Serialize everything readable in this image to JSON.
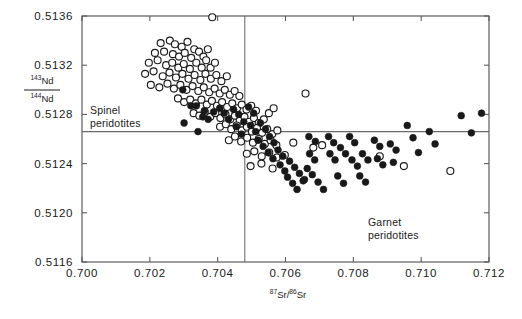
{
  "figure": {
    "background": "#ffffff",
    "frame_color": "#55555a",
    "open_marker_color": "#ffffff",
    "filled_marker_color": "#191919",
    "label_spinel_line1": "Spinel",
    "label_spinel_line2": "peridotites",
    "label_garnet_line1": "Garnet",
    "label_garnet_line2": "peridotites",
    "ylabel_numerator_sup": "143",
    "ylabel_numerator_base": "Nd",
    "ylabel_denominator_sup": "144",
    "ylabel_denominator_base": "Nd",
    "xlabel_sup1": "87",
    "xlabel_base1": "Sr",
    "xlabel_slash": "/",
    "xlabel_sup2": "86",
    "xlabel_base2": "Sr"
  },
  "chart_data": {
    "type": "scatter",
    "title": "",
    "xlabel": "87Sr/86Sr",
    "ylabel": "143Nd/144Nd",
    "xlim": [
      0.7,
      0.712
    ],
    "ylim": [
      0.5116,
      0.5136
    ],
    "xticks": [
      0.7,
      0.702,
      0.704,
      0.706,
      0.708,
      0.71,
      0.712
    ],
    "xtick_labels": [
      "0.700",
      "0.702",
      "0.704",
      "0.706",
      "0.708",
      "0.710",
      "0.712"
    ],
    "yticks": [
      0.5116,
      0.512,
      0.5124,
      0.5128,
      0.5132,
      0.5136
    ],
    "ytick_labels": [
      "0.5116",
      "0.5120",
      "0.5124",
      "0.5128",
      "0.5132",
      "0.5136"
    ],
    "grid": false,
    "legend": "none",
    "reference_lines": [
      {
        "orientation": "horizontal",
        "value": 0.51266,
        "name": "chur-nd-reference-line"
      },
      {
        "orientation": "vertical",
        "value": 0.7048,
        "name": "sr-divider-line"
      }
    ],
    "annotations": [
      {
        "text": "Spinel peridotites",
        "x": 0.7007,
        "y": 0.5129
      },
      {
        "text": "Garnet peridotites",
        "x": 0.7073,
        "y": 0.51205
      }
    ],
    "series": [
      {
        "name": "Spinel peridotites",
        "marker": "open-circle",
        "points": [
          [
            0.70384,
            0.51359
          ],
          [
            0.70232,
            0.51338
          ],
          [
            0.70259,
            0.5134
          ],
          [
            0.70274,
            0.51337
          ],
          [
            0.70294,
            0.51335
          ],
          [
            0.70311,
            0.51339
          ],
          [
            0.70331,
            0.51333
          ],
          [
            0.70215,
            0.5133
          ],
          [
            0.70242,
            0.51331
          ],
          [
            0.70268,
            0.51329
          ],
          [
            0.70286,
            0.51327
          ],
          [
            0.70303,
            0.5133
          ],
          [
            0.70322,
            0.51326
          ],
          [
            0.70345,
            0.51331
          ],
          [
            0.70358,
            0.51327
          ],
          [
            0.70371,
            0.51333
          ],
          [
            0.70197,
            0.51322
          ],
          [
            0.70223,
            0.51324
          ],
          [
            0.70248,
            0.5132
          ],
          [
            0.70266,
            0.51322
          ],
          [
            0.70284,
            0.51318
          ],
          [
            0.703,
            0.51321
          ],
          [
            0.70318,
            0.51317
          ],
          [
            0.70337,
            0.51322
          ],
          [
            0.70353,
            0.51318
          ],
          [
            0.70366,
            0.51324
          ],
          [
            0.70379,
            0.51318
          ],
          [
            0.70392,
            0.51322
          ],
          [
            0.70186,
            0.51313
          ],
          [
            0.70211,
            0.51315
          ],
          [
            0.70238,
            0.51311
          ],
          [
            0.70258,
            0.51314
          ],
          [
            0.70277,
            0.5131
          ],
          [
            0.70296,
            0.51313
          ],
          [
            0.70314,
            0.51309
          ],
          [
            0.70332,
            0.51312
          ],
          [
            0.70349,
            0.51308
          ],
          [
            0.70364,
            0.51313
          ],
          [
            0.7038,
            0.51309
          ],
          [
            0.70396,
            0.51312
          ],
          [
            0.70411,
            0.51307
          ],
          [
            0.70427,
            0.51311
          ],
          [
            0.70203,
            0.51304
          ],
          [
            0.70228,
            0.51302
          ],
          [
            0.70252,
            0.51305
          ],
          [
            0.70271,
            0.51301
          ],
          [
            0.7029,
            0.51304
          ],
          [
            0.70308,
            0.513
          ],
          [
            0.70326,
            0.51303
          ],
          [
            0.70343,
            0.51299
          ],
          [
            0.70359,
            0.51302
          ],
          [
            0.70375,
            0.51298
          ],
          [
            0.70391,
            0.51301
          ],
          [
            0.70406,
            0.51297
          ],
          [
            0.70421,
            0.513
          ],
          [
            0.70436,
            0.51296
          ],
          [
            0.7045,
            0.51299
          ],
          [
            0.70464,
            0.51295
          ],
          [
            0.70283,
            0.51293
          ],
          [
            0.70301,
            0.5129
          ],
          [
            0.70319,
            0.51292
          ],
          [
            0.70336,
            0.51289
          ],
          [
            0.70352,
            0.51292
          ],
          [
            0.70368,
            0.51288
          ],
          [
            0.70383,
            0.51291
          ],
          [
            0.70398,
            0.51287
          ],
          [
            0.70413,
            0.5129
          ],
          [
            0.70428,
            0.51286
          ],
          [
            0.70443,
            0.51289
          ],
          [
            0.70457,
            0.51285
          ],
          [
            0.70471,
            0.51288
          ],
          [
            0.70485,
            0.51284
          ],
          [
            0.70499,
            0.51287
          ],
          [
            0.70513,
            0.51283
          ],
          [
            0.70329,
            0.51281
          ],
          [
            0.70346,
            0.51279
          ],
          [
            0.70362,
            0.51282
          ],
          [
            0.70378,
            0.51278
          ],
          [
            0.70393,
            0.51281
          ],
          [
            0.70408,
            0.51277
          ],
          [
            0.70423,
            0.5128
          ],
          [
            0.70437,
            0.51276
          ],
          [
            0.70451,
            0.51279
          ],
          [
            0.70465,
            0.51275
          ],
          [
            0.70479,
            0.51278
          ],
          [
            0.70493,
            0.51274
          ],
          [
            0.70507,
            0.51277
          ],
          [
            0.70521,
            0.51273
          ],
          [
            0.70536,
            0.51276
          ],
          [
            0.70551,
            0.51281
          ],
          [
            0.70565,
            0.51285
          ],
          [
            0.70407,
            0.5127
          ],
          [
            0.70424,
            0.51272
          ],
          [
            0.7044,
            0.51268
          ],
          [
            0.70456,
            0.51271
          ],
          [
            0.70471,
            0.51267
          ],
          [
            0.70486,
            0.5127
          ],
          [
            0.70501,
            0.51266
          ],
          [
            0.70516,
            0.51269
          ],
          [
            0.70531,
            0.51265
          ],
          [
            0.70546,
            0.51268
          ],
          [
            0.70561,
            0.51264
          ],
          [
            0.70576,
            0.51267
          ],
          [
            0.70433,
            0.51259
          ],
          [
            0.70451,
            0.51262
          ],
          [
            0.70469,
            0.51258
          ],
          [
            0.70487,
            0.51261
          ],
          [
            0.70504,
            0.51257
          ],
          [
            0.70521,
            0.5126
          ],
          [
            0.70539,
            0.51256
          ],
          [
            0.70556,
            0.51259
          ],
          [
            0.70573,
            0.51255
          ],
          [
            0.70486,
            0.51248
          ],
          [
            0.70508,
            0.5125
          ],
          [
            0.7053,
            0.51246
          ],
          [
            0.70552,
            0.51249
          ],
          [
            0.70574,
            0.51245
          ],
          [
            0.70497,
            0.51238
          ],
          [
            0.70529,
            0.5124
          ],
          [
            0.70562,
            0.51236
          ],
          [
            0.70598,
            0.51247
          ],
          [
            0.70623,
            0.51257
          ],
          [
            0.70659,
            0.51297
          ],
          [
            0.70682,
            0.51253
          ],
          [
            0.70708,
            0.51255
          ],
          [
            0.70878,
            0.51246
          ],
          [
            0.70949,
            0.51238
          ],
          [
            0.71086,
            0.51234
          ]
        ]
      },
      {
        "name": "Garnet peridotites",
        "marker": "filled-circle",
        "points": [
          [
            0.70297,
            0.513
          ],
          [
            0.70321,
            0.51287
          ],
          [
            0.70337,
            0.51287
          ],
          [
            0.70356,
            0.51278
          ],
          [
            0.70372,
            0.51276
          ],
          [
            0.70301,
            0.51273
          ],
          [
            0.70388,
            0.51282
          ],
          [
            0.70342,
            0.51266
          ],
          [
            0.70361,
            0.51283
          ],
          [
            0.70406,
            0.51285
          ],
          [
            0.70419,
            0.51281
          ],
          [
            0.70432,
            0.51276
          ],
          [
            0.70447,
            0.51284
          ],
          [
            0.70462,
            0.5128
          ],
          [
            0.70477,
            0.51274
          ],
          [
            0.70455,
            0.5127
          ],
          [
            0.7047,
            0.51264
          ],
          [
            0.70491,
            0.51286
          ],
          [
            0.70506,
            0.51281
          ],
          [
            0.70497,
            0.51271
          ],
          [
            0.70512,
            0.51266
          ],
          [
            0.70526,
            0.51273
          ],
          [
            0.70541,
            0.51268
          ],
          [
            0.70519,
            0.51259
          ],
          [
            0.70534,
            0.51254
          ],
          [
            0.70553,
            0.51262
          ],
          [
            0.70566,
            0.51257
          ],
          [
            0.70549,
            0.51249
          ],
          [
            0.70563,
            0.51244
          ],
          [
            0.70578,
            0.51251
          ],
          [
            0.70592,
            0.51246
          ],
          [
            0.70584,
            0.51239
          ],
          [
            0.70598,
            0.51234
          ],
          [
            0.70612,
            0.51242
          ],
          [
            0.70627,
            0.51237
          ],
          [
            0.70606,
            0.51229
          ],
          [
            0.70621,
            0.51224
          ],
          [
            0.70641,
            0.51232
          ],
          [
            0.70656,
            0.51227
          ],
          [
            0.70634,
            0.51219
          ],
          [
            0.70652,
            0.51226
          ],
          [
            0.70669,
            0.51262
          ],
          [
            0.70688,
            0.51258
          ],
          [
            0.70671,
            0.51248
          ],
          [
            0.70686,
            0.51243
          ],
          [
            0.70664,
            0.51236
          ],
          [
            0.70679,
            0.51231
          ],
          [
            0.70696,
            0.51225
          ],
          [
            0.70712,
            0.51219
          ],
          [
            0.70727,
            0.51262
          ],
          [
            0.70742,
            0.51257
          ],
          [
            0.70731,
            0.51248
          ],
          [
            0.70746,
            0.51243
          ],
          [
            0.70762,
            0.51253
          ],
          [
            0.70777,
            0.51248
          ],
          [
            0.70754,
            0.5123
          ],
          [
            0.70771,
            0.51224
          ],
          [
            0.70789,
            0.51262
          ],
          [
            0.70804,
            0.51257
          ],
          [
            0.70796,
            0.51243
          ],
          [
            0.70812,
            0.51238
          ],
          [
            0.70827,
            0.51248
          ],
          [
            0.70843,
            0.51243
          ],
          [
            0.70819,
            0.5123
          ],
          [
            0.70836,
            0.51225
          ],
          [
            0.70862,
            0.51259
          ],
          [
            0.70878,
            0.51254
          ],
          [
            0.70871,
            0.51244
          ],
          [
            0.70887,
            0.51239
          ],
          [
            0.70909,
            0.51256
          ],
          [
            0.70926,
            0.51251
          ],
          [
            0.70918,
            0.51241
          ],
          [
            0.70959,
            0.51271
          ],
          [
            0.70976,
            0.51261
          ],
          [
            0.70992,
            0.51249
          ],
          [
            0.71024,
            0.51266
          ],
          [
            0.71041,
            0.51256
          ],
          [
            0.71118,
            0.51279
          ],
          [
            0.71148,
            0.51265
          ],
          [
            0.71178,
            0.51281
          ]
        ]
      }
    ]
  }
}
